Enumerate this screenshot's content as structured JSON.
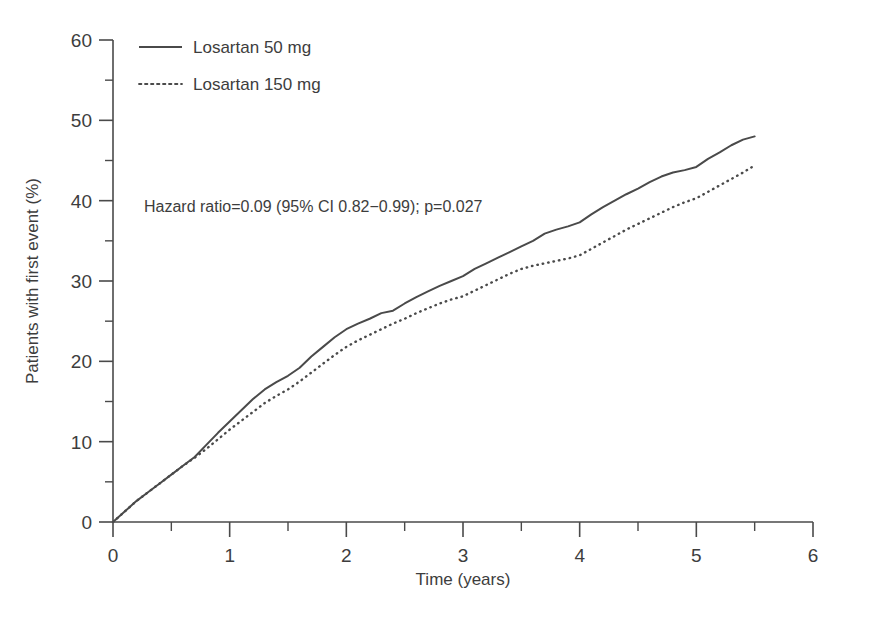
{
  "chart_data": {
    "type": "line",
    "title": "",
    "xlabel": "Time (years)",
    "ylabel": "Patients with first event (%)",
    "xlim": [
      0,
      6
    ],
    "ylim": [
      0,
      60
    ],
    "xticks": [
      "0",
      "1",
      "2",
      "3",
      "4",
      "5",
      "6"
    ],
    "xtick_values": [
      0,
      1,
      2,
      3,
      4,
      5,
      6
    ],
    "x_minor_ticks": [
      0.5,
      1.5,
      2.5,
      3.5,
      4.5,
      5.5
    ],
    "yticks": [
      "0",
      "10",
      "20",
      "30",
      "40",
      "50",
      "60"
    ],
    "ytick_values": [
      0,
      10,
      20,
      30,
      40,
      50,
      60
    ],
    "y_minor_ticks": [
      5,
      15,
      25,
      35,
      45,
      55
    ],
    "grid": false,
    "legend_position": "top-left",
    "line_color": "#4a4a4a",
    "axis_color": "#4a4a4a",
    "annotation": "Hazard ratio=0.09 (95% CI 0.82−0.99); p=0.027",
    "series": [
      {
        "name": "Losartan 50 mg",
        "style": "solid",
        "color": "#4a4a4a",
        "x": [
          0,
          0.1,
          0.2,
          0.3,
          0.4,
          0.5,
          0.6,
          0.7,
          0.8,
          0.9,
          1.0,
          1.1,
          1.2,
          1.3,
          1.4,
          1.5,
          1.6,
          1.7,
          1.8,
          1.9,
          2.0,
          2.1,
          2.2,
          2.3,
          2.4,
          2.5,
          2.6,
          2.7,
          2.8,
          2.9,
          3.0,
          3.1,
          3.2,
          3.3,
          3.4,
          3.5,
          3.6,
          3.7,
          3.8,
          3.9,
          4.0,
          4.1,
          4.2,
          4.3,
          4.4,
          4.5,
          4.6,
          4.7,
          4.8,
          4.9,
          5.0,
          5.1,
          5.2,
          5.3,
          5.4,
          5.5
        ],
        "y": [
          0,
          1.3,
          2.6,
          3.7,
          4.8,
          5.9,
          7.0,
          8.1,
          9.6,
          11.1,
          12.5,
          13.9,
          15.3,
          16.5,
          17.4,
          18.2,
          19.2,
          20.6,
          21.8,
          23.0,
          24.0,
          24.7,
          25.3,
          26.0,
          26.3,
          27.2,
          28.0,
          28.7,
          29.4,
          30.0,
          30.6,
          31.5,
          32.2,
          32.9,
          33.6,
          34.3,
          35.0,
          35.9,
          36.4,
          36.8,
          37.3,
          38.3,
          39.2,
          40.0,
          40.8,
          41.5,
          42.3,
          43.0,
          43.5,
          43.8,
          44.2,
          45.2,
          46.0,
          46.9,
          47.6,
          48.0
        ]
      },
      {
        "name": "Losartan 150 mg",
        "style": "dotted",
        "color": "#4a4a4a",
        "x": [
          0,
          0.1,
          0.2,
          0.3,
          0.4,
          0.5,
          0.6,
          0.7,
          0.8,
          0.9,
          1.0,
          1.1,
          1.2,
          1.3,
          1.4,
          1.5,
          1.6,
          1.7,
          1.8,
          1.9,
          2.0,
          2.1,
          2.2,
          2.3,
          2.4,
          2.5,
          2.6,
          2.7,
          2.8,
          2.9,
          3.0,
          3.1,
          3.2,
          3.3,
          3.4,
          3.5,
          3.6,
          3.7,
          3.8,
          3.9,
          4.0,
          4.1,
          4.2,
          4.3,
          4.4,
          4.5,
          4.6,
          4.7,
          4.8,
          4.9,
          5.0,
          5.1,
          5.2,
          5.3,
          5.4,
          5.5
        ],
        "y": [
          0,
          1.3,
          2.6,
          3.7,
          4.8,
          5.9,
          7.0,
          8.0,
          9.1,
          10.3,
          11.5,
          12.6,
          13.7,
          14.8,
          15.7,
          16.5,
          17.5,
          18.6,
          19.7,
          20.8,
          21.8,
          22.6,
          23.3,
          24.0,
          24.7,
          25.3,
          26.0,
          26.6,
          27.2,
          27.7,
          28.1,
          28.8,
          29.5,
          30.2,
          30.9,
          31.5,
          31.9,
          32.2,
          32.5,
          32.8,
          33.2,
          34.0,
          34.8,
          35.6,
          36.4,
          37.1,
          37.8,
          38.5,
          39.2,
          39.8,
          40.3,
          41.1,
          41.9,
          42.7,
          43.5,
          44.4
        ]
      }
    ]
  },
  "legend": {
    "items": [
      {
        "label": "Losartan 50 mg",
        "style": "solid"
      },
      {
        "label": "Losartan 150 mg",
        "style": "dotted"
      }
    ]
  },
  "axes": {
    "x_title": "Time (years)",
    "y_title": "Patients with first event (%)"
  },
  "annotation": {
    "text": "Hazard ratio=0.09 (95% CI 0.82−0.99); p=0.027"
  }
}
